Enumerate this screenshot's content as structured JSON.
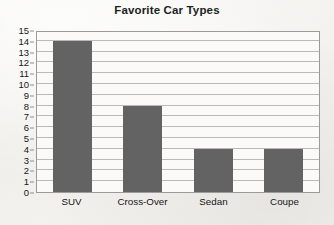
{
  "chart_data": {
    "type": "bar",
    "title": "Favorite Car Types",
    "categories": [
      "SUV",
      "Cross-Over",
      "Sedan",
      "Coupe"
    ],
    "values": [
      14,
      8,
      4,
      4
    ],
    "xlabel": "",
    "ylabel": "",
    "ylim": [
      0,
      15
    ],
    "y_ticks": [
      0,
      1,
      2,
      3,
      4,
      5,
      6,
      7,
      8,
      9,
      10,
      11,
      12,
      13,
      14,
      15
    ],
    "y_tick_step": 1,
    "grid": true,
    "legend": false,
    "bar_color": "#636363",
    "plot_background": "#fbfaf8",
    "grid_color": "#b9b9b9",
    "frame_color": "#9a9a9a",
    "page_background": "#f4f3f1",
    "title_color": "#201f1d",
    "tick_label_color": "#17161a"
  }
}
